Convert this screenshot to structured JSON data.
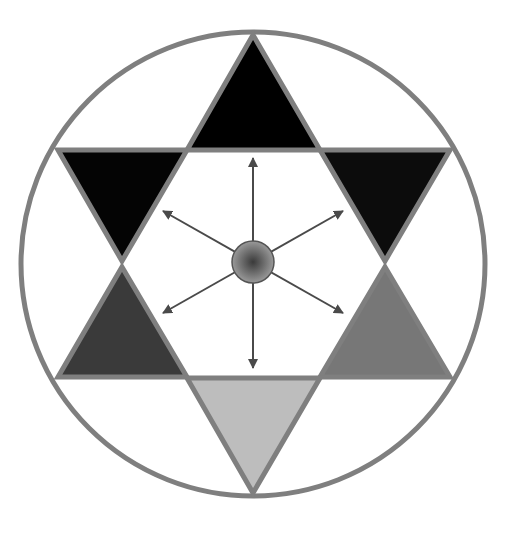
{
  "diagram": {
    "type": "hexagram-in-circle",
    "colors": {
      "background": "#ffffff",
      "outline": "#7f7f7f",
      "arrow": "#4a4a4a",
      "center_ball_light": "#9a9a9a",
      "center_ball_dark": "#3a3a3a"
    },
    "circle": {
      "cx": 253,
      "cy": 264,
      "r": 232,
      "stroke_width": 5
    },
    "triangles": [
      {
        "id": "top",
        "points": "253,35 320,150 187,150",
        "fill": "#000000"
      },
      {
        "id": "upper-left",
        "points": "58,150 187,150 122,261",
        "fill": "#040404"
      },
      {
        "id": "upper-right",
        "points": "320,150 450,150 385,261",
        "fill": "#0c0c0c"
      },
      {
        "id": "lower-left",
        "points": "122,267 187,377 58,377",
        "fill": "#3a3a3a"
      },
      {
        "id": "lower-right",
        "points": "385,267 450,377 320,377",
        "fill": "#777777"
      },
      {
        "id": "bottom",
        "points": "187,378 320,378 253,493",
        "fill": "#bdbdbd"
      }
    ],
    "center": {
      "cx": 253,
      "cy": 262,
      "r": 21
    },
    "arrows": [
      {
        "id": "up",
        "x2": 253,
        "y2": 158
      },
      {
        "id": "down",
        "x2": 253,
        "y2": 368
      },
      {
        "id": "up-left",
        "x2": 163,
        "y2": 211
      },
      {
        "id": "up-right",
        "x2": 343,
        "y2": 211
      },
      {
        "id": "down-left",
        "x2": 163,
        "y2": 313
      },
      {
        "id": "down-right",
        "x2": 343,
        "y2": 313
      }
    ]
  }
}
